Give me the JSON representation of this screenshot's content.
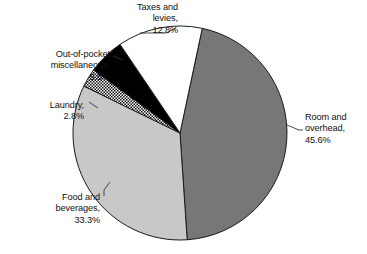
{
  "chart_data": {
    "type": "pie",
    "title": "",
    "subtitle": "",
    "xlabel": "",
    "ylabel": "",
    "legend_position": "none",
    "grid": false,
    "units": "percent",
    "start_angle_deg": 12,
    "direction": "clockwise",
    "categories": [
      "Room and overhead",
      "Food and beverages",
      "Laundry",
      "Out-of-pocket miscellaneous",
      "Taxes and levies"
    ],
    "values": [
      45.6,
      33.3,
      2.8,
      5.5,
      12.8
    ],
    "slices": [
      {
        "name": "Room and overhead",
        "value": 45.6,
        "value_text": "45.6%",
        "label_text": "Room and\noverhead,\n45.6%",
        "fill": "#777777",
        "pattern": "solid",
        "stroke": "#1a1a1a"
      },
      {
        "name": "Food and beverages",
        "value": 33.3,
        "value_text": "33.3%",
        "label_text": "Food and\nbeverages,\n33.3%",
        "fill": "#c8c8c8",
        "pattern": "solid",
        "stroke": "#1a1a1a"
      },
      {
        "name": "Laundry",
        "value": 2.8,
        "value_text": "2.8%",
        "label_text": "Laundry,\n2.8%",
        "fill": "#ffffff",
        "pattern": "checkerboard",
        "stroke": "#1a1a1a"
      },
      {
        "name": "Out-of-pocket miscellaneous",
        "value": 5.5,
        "value_text": "5.5%",
        "label_text": "Out-of-pocket\nmiscellaneous,\n5.5%",
        "fill": "#000000",
        "pattern": "solid",
        "stroke": "#1a1a1a"
      },
      {
        "name": "Taxes and levies",
        "value": 12.8,
        "value_text": "12.8%",
        "label_text": "Taxes and\nlevies,\n12.8%",
        "fill": "#ffffff",
        "pattern": "solid",
        "stroke": "#1a1a1a"
      }
    ]
  },
  "colors": {
    "room_and_overhead": "#777777",
    "food_and_beverages": "#c8c8c8",
    "laundry": "#ffffff",
    "out_of_pocket": "#000000",
    "taxes_and_levies": "#ffffff",
    "outline": "#1a1a1a",
    "leader_line": "#333333",
    "background": "#ffffff",
    "text": "#111111"
  }
}
